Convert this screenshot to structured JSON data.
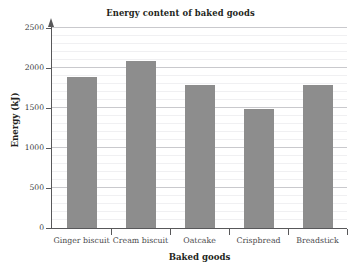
{
  "chart_data": {
    "type": "bar",
    "title": "Energy content of baked goods",
    "xlabel": "Baked goods",
    "ylabel": "Energy (kJ)",
    "categories": [
      "Ginger biscuit",
      "Cream biscuit",
      "Oatcake",
      "Crispbread",
      "Breadstick"
    ],
    "values": [
      1890,
      2090,
      1790,
      1490,
      1790
    ],
    "ylim": [
      0,
      2500
    ],
    "y_ticks": [
      0,
      500,
      1000,
      1500,
      2000,
      2500
    ],
    "y_tick_labels": [
      "0",
      "500",
      "1000",
      "1500",
      "2000",
      "2500"
    ],
    "y_minor_tick_step": 100,
    "grid": true,
    "grid_axis": "y",
    "legend": null,
    "bar_color": "#8d8d8d",
    "axis_color": "#58585a",
    "major_gridline_color": "#c9c9cd",
    "minor_gridline_color": "#f0f0f2",
    "background_color": "#ffffff"
  }
}
